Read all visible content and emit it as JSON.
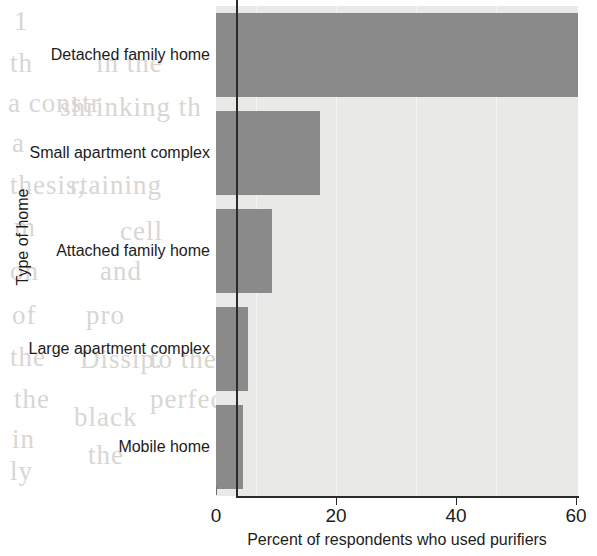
{
  "chart_data": {
    "type": "bar",
    "orientation": "horizontal",
    "title": "",
    "xlabel": "Percent of respondents who used purifiers",
    "ylabel": "Type of home",
    "categories": [
      "Detached family home",
      "Small apartment complex",
      "Attached family home",
      "Large apartment complex",
      "Mobile home"
    ],
    "values": [
      60.3,
      17.3,
      9.3,
      5.3,
      4.5
    ],
    "xlim": [
      0,
      62
    ],
    "ylim": [
      0,
      5
    ],
    "xticks": [
      0,
      20,
      40,
      60
    ],
    "xtick_labels": [
      "0",
      "20",
      "40",
      "60"
    ],
    "grid": false,
    "legend": null,
    "annotations": [
      {
        "name": "reference-line",
        "type": "vertical-line",
        "value": 3.3,
        "label": ""
      }
    ],
    "colors": {
      "bar": "#8a8a8a",
      "plot_background": "#e9e9e7",
      "axis": "#2b2b2b",
      "text": "#1c1c1c",
      "page_background": "#ffffff"
    }
  },
  "bleed_through": [
    {
      "text": "1",
      "x": 14,
      "y": 6
    },
    {
      "text": "th",
      "x": 10,
      "y": 48
    },
    {
      "text": "a constr",
      "x": 8,
      "y": 88
    },
    {
      "text": "a",
      "x": 12,
      "y": 128
    },
    {
      "text": "thesis,",
      "x": 10,
      "y": 170
    },
    {
      "text": "m",
      "x": 14,
      "y": 212
    },
    {
      "text": "on",
      "x": 10,
      "y": 256
    },
    {
      "text": "of",
      "x": 12,
      "y": 300
    },
    {
      "text": "the",
      "x": 10,
      "y": 342
    },
    {
      "text": "the",
      "x": 14,
      "y": 384
    },
    {
      "text": "in",
      "x": 12,
      "y": 424
    },
    {
      "text": "ly",
      "x": 10,
      "y": 456
    },
    {
      "text": "in the",
      "x": 96,
      "y": 48
    },
    {
      "text": "shrinking th",
      "x": 60,
      "y": 92
    },
    {
      "text": "rtaining",
      "x": 70,
      "y": 170
    },
    {
      "text": "and",
      "x": 100,
      "y": 256
    },
    {
      "text": "cell",
      "x": 120,
      "y": 216
    },
    {
      "text": "pro",
      "x": 86,
      "y": 300
    },
    {
      "text": "Dissip.",
      "x": 80,
      "y": 344
    },
    {
      "text": "black",
      "x": 74,
      "y": 402
    },
    {
      "text": "the",
      "x": 88,
      "y": 440
    },
    {
      "text": "to the",
      "x": 150,
      "y": 344
    },
    {
      "text": "perfect",
      "x": 150,
      "y": 384
    }
  ]
}
